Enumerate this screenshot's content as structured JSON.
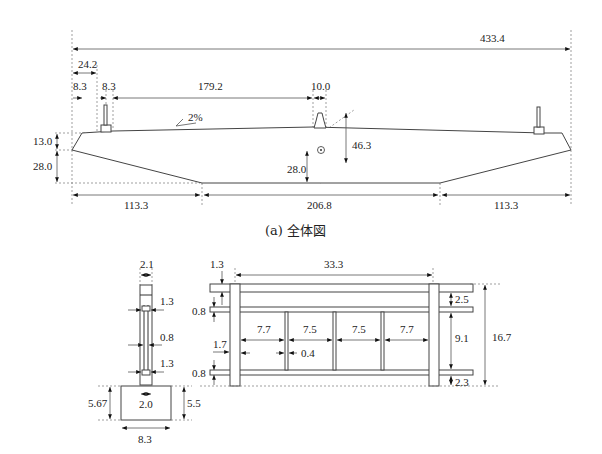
{
  "overall": {
    "caption": "(a) 全体図",
    "total_width": "433.4",
    "dims_top": {
      "edge_to_rail": "24.2",
      "rail_left_width": "8.3",
      "rail_right_offset": "8.3",
      "rail_span": "179.2",
      "median_width": "10.0"
    },
    "slope": "2%",
    "dims_left": {
      "cantilever_edge": "13.0",
      "cantilever_depth": "28.0"
    },
    "dims_center": {
      "centroid_height": "28.0",
      "girder_depth": "46.3"
    },
    "dims_bottom": {
      "left": "113.3",
      "middle": "206.8",
      "right": "113.3"
    }
  },
  "rail_section": {
    "top_width": "2.1",
    "upper_bar": "1.3",
    "web": "0.8",
    "lower_bar": "1.3",
    "base_inner": "2.0",
    "base_height_left": "5.67",
    "base_height_right": "5.5",
    "base_width": "8.3"
  },
  "rail_elevation": {
    "top_offset": "1.3",
    "span": "33.3",
    "upper_rail_gap": "0.8",
    "lower_rail_gap": "0.8",
    "post_offset": "1.7",
    "bays": [
      "7.7",
      "7.5",
      "7.5",
      "7.7"
    ],
    "post_width": "0.4",
    "right_top": "2.5",
    "right_middle": "9.1",
    "right_bottom": "2.3",
    "total_height": "16.7"
  }
}
